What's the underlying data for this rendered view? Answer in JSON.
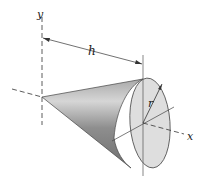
{
  "figure": {
    "labels": {
      "y_axis": "y",
      "x_axis": "x",
      "height": "h",
      "radius": "r"
    },
    "colors": {
      "base_fill": "#dcdcdc",
      "cone_dark": "#7a7a7a",
      "cone_light": "#d8d8d8",
      "line": "#333333"
    }
  }
}
